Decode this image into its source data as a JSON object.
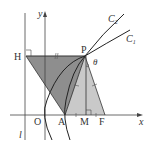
{
  "diagram": {
    "labels": {
      "H": "H",
      "P": "P",
      "O": "O",
      "A": "A",
      "M": "M",
      "F": "F",
      "x_axis": "x",
      "y_axis": "y",
      "directrix": "l",
      "theta": "θ",
      "curve1": "C",
      "curve1_sub": "1",
      "curve2": "C",
      "curve2_sub": "2"
    },
    "colors": {
      "dark_fill": "#8c8c8c",
      "light_fill": "#c8c8c8",
      "line": "#333333"
    }
  }
}
